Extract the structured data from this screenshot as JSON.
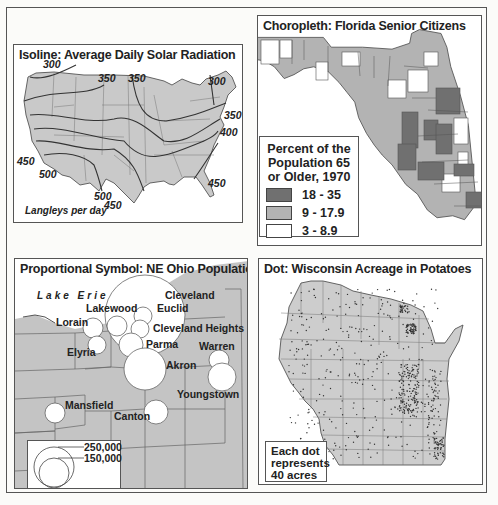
{
  "panels": {
    "isoline": {
      "title": "Isoline: Average Daily Solar Radiation",
      "unit_label": "Langleys per day",
      "contour_labels": [
        {
          "text": "300",
          "x": 29,
          "y": 12
        },
        {
          "text": "350",
          "x": 84,
          "y": 27
        },
        {
          "text": "350",
          "x": 114,
          "y": 27
        },
        {
          "text": "300",
          "x": 194,
          "y": 30
        },
        {
          "text": "350",
          "x": 210,
          "y": 64
        },
        {
          "text": "400",
          "x": 206,
          "y": 81
        },
        {
          "text": "450",
          "x": 3,
          "y": 110
        },
        {
          "text": "500",
          "x": 25,
          "y": 123
        },
        {
          "text": "450",
          "x": 194,
          "y": 132
        },
        {
          "text": "500",
          "x": 80,
          "y": 145
        },
        {
          "text": "450",
          "x": 90,
          "y": 154
        }
      ],
      "colors": {
        "land": "#c9c9c9",
        "lines": "#444444"
      }
    },
    "choropleth": {
      "title": "Choropleth: Florida Senior Citizens",
      "legend": {
        "title_lines": [
          "Percent of the",
          "Population 65",
          "or Older, 1970"
        ],
        "classes": [
          {
            "label": "18 - 35",
            "color": "#707070"
          },
          {
            "label": "9 - 17.9",
            "color": "#b3b3b3"
          },
          {
            "label": "3 - 8.9",
            "color": "#ffffff"
          }
        ]
      }
    },
    "proportional": {
      "title": "Proportional Symbol: NE Ohio Population",
      "water_label": "Lake Erie",
      "cities": [
        {
          "name": "Cleveland",
          "lx": 150,
          "ly": 30
        },
        {
          "name": "Lakewood",
          "lx": 71,
          "ly": 43
        },
        {
          "name": "Euclid",
          "lx": 142,
          "ly": 43
        },
        {
          "name": "Lorain",
          "lx": 41,
          "ly": 57
        },
        {
          "name": "Cleveland Heights",
          "lx": 138,
          "ly": 63
        },
        {
          "name": "Parma",
          "lx": 131,
          "ly": 79
        },
        {
          "name": "Warren",
          "lx": 184,
          "ly": 81
        },
        {
          "name": "Elyria",
          "lx": 52,
          "ly": 87
        },
        {
          "name": "Akron",
          "lx": 151,
          "ly": 100
        },
        {
          "name": "Youngstown",
          "lx": 162,
          "ly": 129
        },
        {
          "name": "Mansfield",
          "lx": 50,
          "ly": 140
        },
        {
          "name": "Canton",
          "lx": 99,
          "ly": 151
        }
      ],
      "legend": {
        "values": [
          "250,000",
          "150,000"
        ]
      },
      "colors": {
        "land": "#c4c4c4",
        "symbol": "#ffffff"
      }
    },
    "dot": {
      "title": "Dot: Wisconsin Acreage in Potatoes",
      "legend_lines": [
        "Each dot",
        "represents",
        "40 acres"
      ],
      "colors": {
        "land": "#cdcdcd",
        "dot": "#333333"
      }
    }
  }
}
